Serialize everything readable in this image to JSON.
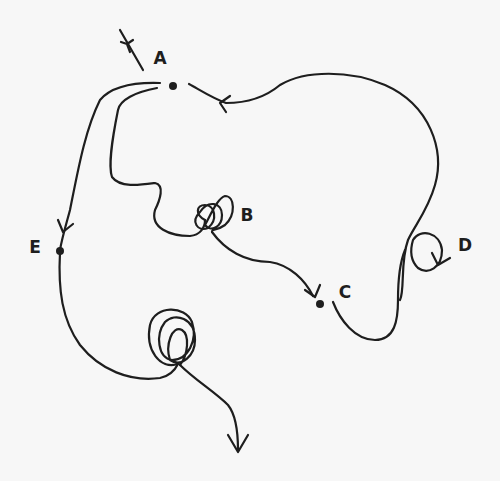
{
  "diagram": {
    "type": "hand-drawn trajectory diagram",
    "background": "#f7f7f7",
    "ink": "#1e1e1e",
    "nodes": [
      {
        "id": "A",
        "label": "A",
        "x": 173,
        "y": 86
      },
      {
        "id": "B",
        "label": "B",
        "x": 205,
        "y": 215
      },
      {
        "id": "C",
        "label": "C",
        "x": 320,
        "y": 304
      },
      {
        "id": "D",
        "label": "D",
        "x": 430,
        "y": 255
      },
      {
        "id": "E",
        "label": "E",
        "x": 60,
        "y": 251
      }
    ],
    "labels": [
      {
        "text": "A",
        "x": 160,
        "y": 58
      },
      {
        "text": "B",
        "x": 247,
        "y": 215
      },
      {
        "text": "C",
        "x": 345,
        "y": 292
      },
      {
        "text": "D",
        "x": 465,
        "y": 245
      },
      {
        "text": "E",
        "x": 35,
        "y": 247
      }
    ],
    "edges": [
      {
        "from": "incoming",
        "to": "A",
        "note": "arrow entering A from upper-left"
      },
      {
        "from": "D",
        "to": "A",
        "note": "large loop along right side arriving at A with arrow"
      },
      {
        "from": "A",
        "to": "E",
        "note": "down the left side with arrow into E"
      },
      {
        "from": "A",
        "to": "B",
        "note": "winding path ending in tangled loops at B"
      },
      {
        "from": "B",
        "to": "C",
        "note": "curve with arrow into C"
      },
      {
        "from": "C",
        "to": "D",
        "note": "S-curve up to D with small loop and arrow"
      },
      {
        "from": "E",
        "to": "outgoing",
        "note": "down then tangle of loops, exits downward with arrow"
      }
    ]
  }
}
